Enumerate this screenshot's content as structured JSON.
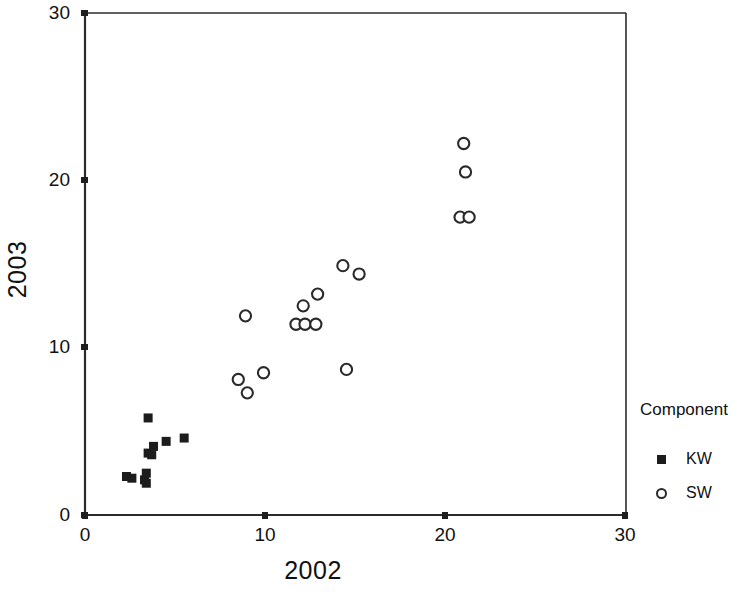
{
  "chart_data": {
    "type": "scatter",
    "title": "",
    "xlabel": "2002",
    "ylabel": "2003",
    "xlim": [
      0,
      30
    ],
    "ylim": [
      0,
      30
    ],
    "xticks": [
      "0",
      "10",
      "20",
      "30"
    ],
    "yticks": [
      "0",
      "10",
      "20",
      "30"
    ],
    "xtick_values": [
      0,
      10,
      20,
      30
    ],
    "ytick_values": [
      0,
      10,
      20,
      30
    ],
    "grid": false,
    "legend": {
      "title": "Component",
      "position": "right",
      "entries": [
        {
          "label": "KW",
          "marker": "filled-square"
        },
        {
          "label": "SW",
          "marker": "open-circle"
        }
      ]
    },
    "series": [
      {
        "name": "KW",
        "marker": "filled-square",
        "color": "#1c1c1c",
        "points": [
          [
            2.3,
            2.3
          ],
          [
            2.6,
            2.2
          ],
          [
            3.3,
            2.1
          ],
          [
            3.4,
            2.5
          ],
          [
            3.4,
            1.9
          ],
          [
            3.5,
            3.7
          ],
          [
            3.7,
            3.6
          ],
          [
            3.8,
            4.1
          ],
          [
            3.5,
            5.8
          ],
          [
            4.5,
            4.4
          ],
          [
            5.5,
            4.6
          ]
        ]
      },
      {
        "name": "SW",
        "marker": "open-circle",
        "color": "#2a2a2a",
        "points": [
          [
            8.5,
            8.1
          ],
          [
            9.0,
            7.3
          ],
          [
            8.9,
            11.9
          ],
          [
            9.9,
            8.5
          ],
          [
            11.7,
            11.4
          ],
          [
            12.2,
            11.4
          ],
          [
            12.1,
            12.5
          ],
          [
            12.8,
            11.4
          ],
          [
            12.9,
            13.2
          ],
          [
            14.3,
            14.9
          ],
          [
            15.2,
            14.4
          ],
          [
            14.5,
            8.7
          ],
          [
            21.0,
            22.2
          ],
          [
            21.1,
            20.5
          ],
          [
            20.8,
            17.8
          ],
          [
            21.3,
            17.8
          ]
        ]
      }
    ]
  },
  "axes": {
    "x_title": "2002",
    "y_title": "2003"
  }
}
